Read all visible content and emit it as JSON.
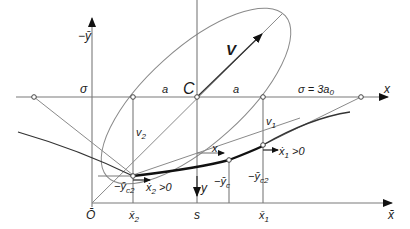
{
  "diagram": {
    "type": "geometric construction",
    "colors": {
      "line": "#8a8a8a",
      "curve": "#111111",
      "label": "#1a1a1a"
    },
    "labels": {
      "neg_ybar_axis": "−ȳ",
      "x_axis": "x",
      "xbar_axis": "x̄",
      "sigma_left": "σ",
      "a_left": "a",
      "center": "C",
      "a_right": "a",
      "sigma_right": "σ = 3a",
      "sigma_right_sub": "0",
      "velocity": "V",
      "v2": "v",
      "v2_sub": "2",
      "v1": "v",
      "v1_sub": "1",
      "x_local": "x",
      "y_local": "y",
      "neg_yc2_left": "−ȳ",
      "neg_yc2_left_sub": "c2",
      "x2dot": "ẋ",
      "x2dot_sub": "2",
      "x2dot_cond": " >0",
      "x1dot": "ẋ",
      "x1dot_sub": "1",
      "x1dot_cond": " >0",
      "neg_yc": "−ȳ",
      "neg_yc_sub": "c",
      "neg_yc2_right": "−ȳ",
      "neg_yc2_right_sub": "c2",
      "origin": "Ō",
      "xbar2": "x̄",
      "xbar2_sub": "2",
      "s": "s",
      "xbar1": "x̄",
      "xbar1_sub": "1"
    }
  }
}
